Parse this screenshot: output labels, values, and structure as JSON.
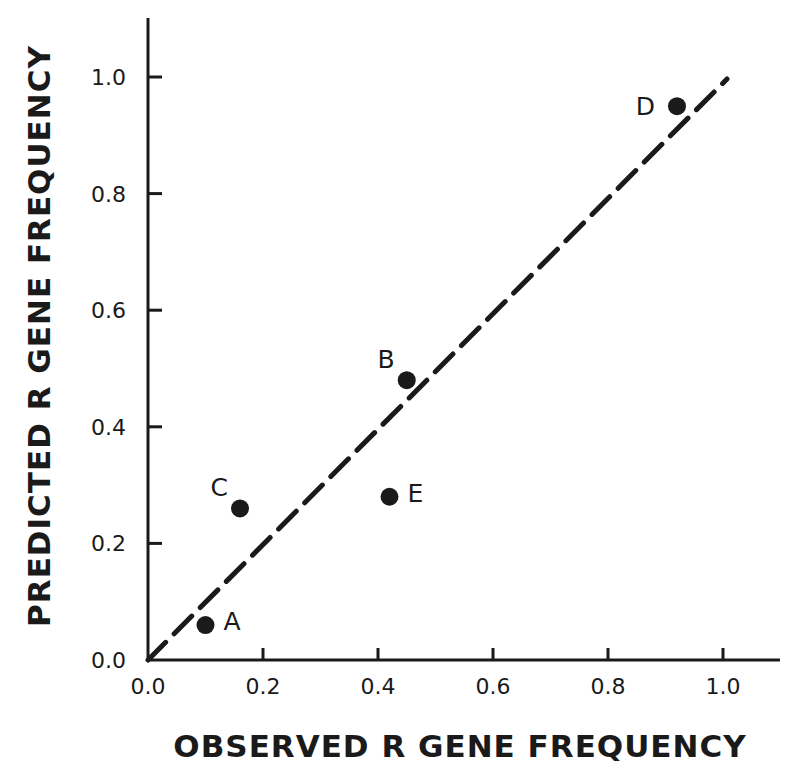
{
  "chart_data": {
    "type": "scatter",
    "title": "",
    "xlabel": "OBSERVED R GENE FREQUENCY",
    "ylabel": "PREDICTED R GENE FREQUENCY",
    "xlim": [
      0.0,
      1.1
    ],
    "ylim": [
      0.0,
      1.1
    ],
    "grid": false,
    "legend": null,
    "x_ticks": [
      "0.0",
      "0.2",
      "0.4",
      "0.6",
      "0.8",
      "1.0"
    ],
    "y_ticks": [
      "0.0",
      "0.2",
      "0.4",
      "0.6",
      "0.8",
      "1.0"
    ],
    "points": [
      {
        "label": "A",
        "x": 0.1,
        "y": 0.06,
        "label_side": "right"
      },
      {
        "label": "B",
        "x": 0.45,
        "y": 0.48,
        "label_side": "upper-left"
      },
      {
        "label": "C",
        "x": 0.16,
        "y": 0.26,
        "label_side": "upper-left"
      },
      {
        "label": "D",
        "x": 0.92,
        "y": 0.95,
        "label_side": "left"
      },
      {
        "label": "E",
        "x": 0.42,
        "y": 0.28,
        "label_side": "right"
      }
    ],
    "reference_line": {
      "style": "dashed",
      "from": [
        0.0,
        0.0
      ],
      "to": [
        1.0,
        1.0
      ],
      "description": "1:1 line"
    }
  },
  "colors": {
    "ink": "#1a1a1a",
    "background": "#ffffff"
  }
}
